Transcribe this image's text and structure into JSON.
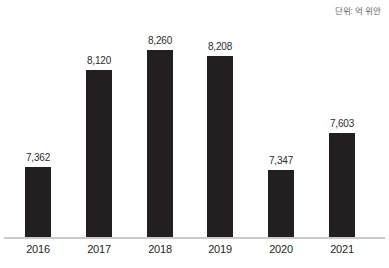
{
  "caption": {
    "unit_label": "단위: 억 위안"
  },
  "chart_data": {
    "type": "bar",
    "title": "",
    "subtitle": "",
    "xlabel": "",
    "ylabel": "",
    "unit": "단위: 억 위안",
    "grid": false,
    "legend": false,
    "axis_visible": {
      "x_baseline": true,
      "y_axis": false,
      "y_ticks": false
    },
    "categories": [
      "2016",
      "2017",
      "2018",
      "2019",
      "2020",
      "2021"
    ],
    "values": [
      7362,
      8120,
      8260,
      8208,
      7347,
      7603
    ],
    "value_labels": [
      "7,362",
      "8,120",
      "8,260",
      "8,208",
      "7,347",
      "7,603"
    ],
    "bar_color": "#231f20",
    "value_label_color": "#2b2b2b",
    "category_label_color": "#231f20",
    "axis_line_color": "#c9cacc",
    "background_color": "#ffffff",
    "note": "Bar lengths are drawn on a broken (non-zero) baseline; pixel heights are listed in layout.bar_pixel_heights.",
    "layout": {
      "bar_pixel_heights": [
        71,
        168,
        188,
        182,
        68,
        105
      ],
      "bar_width_px": 26,
      "baseline_y_px": 238,
      "group_left_px": [
        8,
        69,
        130,
        190,
        251,
        312
      ],
      "group_width_px": 60
    }
  }
}
